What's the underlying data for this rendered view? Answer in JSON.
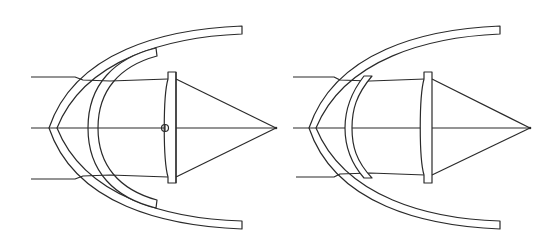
{
  "diagram": {
    "stroke_color": "#2a2a2a",
    "background": "#ffffff",
    "figures": [
      {
        "id": "left",
        "components": [
          "outer-dome",
          "inner-dome-corrector",
          "focusing-lens",
          "pivot-marker",
          "optical-axis",
          "marginal-rays",
          "focal-point"
        ]
      },
      {
        "id": "right",
        "components": [
          "outer-dome",
          "meniscus-corrector",
          "focusing-lens",
          "optical-axis",
          "marginal-rays",
          "focal-point"
        ]
      }
    ]
  }
}
